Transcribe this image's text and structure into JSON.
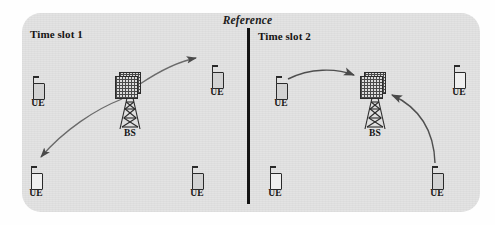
{
  "figure": {
    "title": "Reference",
    "background_color": "#e3e3e3",
    "page_color": "#fefefe",
    "ink_color": "#141414"
  },
  "divider": {
    "name": "vertical-divider",
    "color": "#131313"
  },
  "panels": [
    {
      "id": "time-slot-1",
      "title": "Time slot 1",
      "base_station": {
        "label": "BS",
        "x": 130,
        "y": 76
      },
      "devices": [
        {
          "label": "UE",
          "id": "slot1-ue-left",
          "x": 25,
          "y": 76
        },
        {
          "label": "UE",
          "id": "slot1-ue-top-right",
          "x": 204,
          "y": 65
        },
        {
          "label": "UE",
          "id": "slot1-ue-bottom-left",
          "x": 23,
          "y": 166
        },
        {
          "label": "UE",
          "id": "slot1-ue-bottom-mid",
          "x": 184,
          "y": 166
        }
      ],
      "links": [
        {
          "id": "slot1-bs-to-top-right-ue",
          "from": "base-station",
          "to": "slot1-ue-top-right",
          "direction": "downlink"
        },
        {
          "id": "slot1-bs-to-bottom-left-ue",
          "from": "base-station",
          "to": "slot1-ue-bottom-left",
          "direction": "downlink"
        }
      ]
    },
    {
      "id": "time-slot-2",
      "title": "Time slot 2",
      "base_station": {
        "label": "BS",
        "x": 362,
        "y": 76
      },
      "devices": [
        {
          "label": "UE",
          "id": "slot2-ue-left",
          "x": 268,
          "y": 76
        },
        {
          "label": "UE",
          "id": "slot2-ue-top-right",
          "x": 446,
          "y": 65
        },
        {
          "label": "UE",
          "id": "slot2-ue-bottom-left",
          "x": 262,
          "y": 166
        },
        {
          "label": "UE",
          "id": "slot2-ue-bottom-right",
          "x": 424,
          "y": 166
        }
      ],
      "links": [
        {
          "id": "slot2-left-ue-to-bs",
          "from": "slot2-ue-left",
          "to": "base-station",
          "direction": "uplink"
        },
        {
          "id": "slot2-bottom-right-ue-to-bs",
          "from": "slot2-ue-bottom-right",
          "to": "base-station",
          "direction": "uplink"
        }
      ]
    }
  ]
}
